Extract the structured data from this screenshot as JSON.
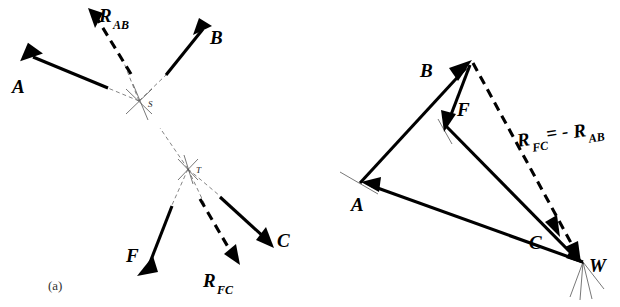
{
  "figure": {
    "caption_a": "(a)",
    "bg_color": "#ffffff",
    "ink_color": "#000000",
    "construction_color": "#666666"
  },
  "space_diagram": {
    "name": "space-diagram",
    "points": [
      {
        "id": "S",
        "label": "S",
        "x": 139,
        "y": 101
      },
      {
        "id": "T",
        "label": "T",
        "x": 188,
        "y": 169
      }
    ],
    "vectors": [
      {
        "id": "A",
        "label": "A",
        "style": "solid",
        "label_x": 12,
        "label_y": 93,
        "sub": ""
      },
      {
        "id": "B",
        "label": "B",
        "style": "solid",
        "label_x": 210,
        "label_y": 44,
        "sub": ""
      },
      {
        "id": "R_AB",
        "label": "R",
        "style": "dashed",
        "label_x": 98,
        "label_y": 20,
        "sub": "AB"
      },
      {
        "id": "F",
        "label": "F",
        "style": "solid",
        "label_x": 126,
        "label_y": 262,
        "sub": ""
      },
      {
        "id": "C",
        "label": "C",
        "style": "solid",
        "label_x": 277,
        "label_y": 247,
        "sub": ""
      },
      {
        "id": "R_FC",
        "label": "R",
        "style": "dashed",
        "label_x": 203,
        "label_y": 285,
        "sub": "FC"
      }
    ]
  },
  "force_polygon": {
    "name": "force-polygon",
    "vertices": [
      {
        "id": "apex",
        "label": "",
        "x": 470,
        "y": 63
      },
      {
        "id": "A",
        "label": "A",
        "x": 360,
        "y": 183
      },
      {
        "id": "W",
        "label": "W",
        "x": 583,
        "y": 262
      }
    ],
    "vectors": [
      {
        "id": "B",
        "label": "B",
        "label_x": 424,
        "label_y": 76,
        "sub": ""
      },
      {
        "id": "F",
        "label": "F",
        "label_x": 457,
        "label_y": 114,
        "sub": ""
      },
      {
        "id": "A",
        "label": "A",
        "label_x": 353,
        "label_y": 209,
        "sub": ""
      },
      {
        "id": "C",
        "label": "C",
        "label_x": 531,
        "label_y": 247,
        "sub": ""
      },
      {
        "id": "W",
        "label": "W",
        "label_x": 590,
        "label_y": 270,
        "sub": ""
      }
    ],
    "equation": {
      "id": "R_FC_eq_minus_R_AB",
      "lead": "R",
      "lead_sub": "FC",
      "operator": "= -",
      "trail": "R",
      "trail_sub": "AB",
      "x": 518,
      "y": 147,
      "full_text": "R_FC = -R_AB"
    }
  }
}
